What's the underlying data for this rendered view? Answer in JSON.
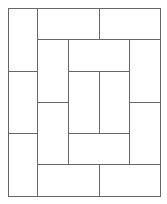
{
  "diagram": {
    "title": "",
    "stroke_color": "#666666",
    "background": "#ffffff",
    "outer": {
      "x": 8,
      "y": 8,
      "w": 152,
      "h": 188
    },
    "tiles": [
      {
        "x": 8,
        "y": 8,
        "w": 29,
        "h": 63
      },
      {
        "x": 8,
        "y": 71,
        "w": 29,
        "h": 62
      },
      {
        "x": 8,
        "y": 133,
        "w": 29,
        "h": 63
      },
      {
        "x": 37,
        "y": 8,
        "w": 62,
        "h": 31
      },
      {
        "x": 99,
        "y": 8,
        "w": 61,
        "h": 31
      },
      {
        "x": 37,
        "y": 39,
        "w": 31,
        "h": 63
      },
      {
        "x": 37,
        "y": 102,
        "w": 31,
        "h": 62
      },
      {
        "x": 68,
        "y": 39,
        "w": 61,
        "h": 32
      },
      {
        "x": 68,
        "y": 71,
        "w": 31,
        "h": 62
      },
      {
        "x": 99,
        "y": 71,
        "w": 30,
        "h": 62
      },
      {
        "x": 68,
        "y": 133,
        "w": 61,
        "h": 31
      },
      {
        "x": 129,
        "y": 39,
        "w": 31,
        "h": 63
      },
      {
        "x": 129,
        "y": 102,
        "w": 31,
        "h": 62
      },
      {
        "x": 37,
        "y": 164,
        "w": 62,
        "h": 32
      },
      {
        "x": 99,
        "y": 164,
        "w": 61,
        "h": 32
      }
    ]
  }
}
